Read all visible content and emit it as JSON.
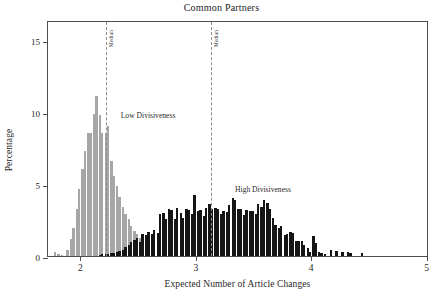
{
  "chart_data": {
    "type": "bar",
    "title": "Common Partners",
    "xlabel": "Expected Number of Article Changes",
    "ylabel": "Percentage",
    "xlim": [
      1.72,
      5.02
    ],
    "ylim": [
      0,
      16.4
    ],
    "xticks": [
      2,
      3,
      4,
      5
    ],
    "xticklabels": [
      "2",
      "3",
      "4",
      "5"
    ],
    "yticks": [
      0,
      5,
      10,
      15
    ],
    "yticklabels": [
      "0",
      "5",
      "10",
      "15"
    ],
    "grid": false,
    "legend_position": "inline-annotations",
    "bin_width": 0.0255,
    "annotations": [
      {
        "text": "Low Divisiveness",
        "x": 2.35,
        "y": 10.2,
        "color": "#2b2b2b"
      },
      {
        "text": "High Divisiveness",
        "x": 3.34,
        "y": 5.1,
        "color": "#2b2b2b"
      },
      {
        "text": "Median",
        "x": 2.22,
        "y": 15.6,
        "orientation": "vertical",
        "color": "#3d3d3d"
      },
      {
        "text": "Median",
        "x": 3.13,
        "y": 15.6,
        "orientation": "vertical",
        "color": "#3d3d3d"
      }
    ],
    "reference_lines": [
      {
        "label": "Median",
        "x": 2.22,
        "style": "dashed",
        "color": "#8c8c8c",
        "series": "Low Divisiveness"
      },
      {
        "label": "Median",
        "x": 3.13,
        "style": "dashed",
        "color": "#8c8c8c",
        "series": "High Divisiveness"
      }
    ],
    "series": [
      {
        "name": "Low Divisiveness",
        "color": "#a6a6a6",
        "x": [
          1.78,
          1.81,
          1.84,
          1.87,
          1.89,
          1.92,
          1.94,
          1.97,
          1.99,
          2.02,
          2.04,
          2.07,
          2.09,
          2.12,
          2.14,
          2.17,
          2.19,
          2.22,
          2.24,
          2.27,
          2.29,
          2.32,
          2.34,
          2.37,
          2.39,
          2.42,
          2.44,
          2.47,
          2.49,
          2.52,
          2.54,
          2.57,
          2.59,
          2.62,
          2.64,
          2.67,
          2.69,
          2.72,
          2.74,
          2.77,
          2.79,
          2.82,
          2.84,
          2.87
        ],
        "values": [
          0.3,
          0.15,
          0.1,
          0.0,
          0.45,
          1.15,
          1.95,
          3.25,
          4.65,
          6.05,
          7.3,
          8.55,
          8.55,
          9.85,
          11.1,
          9.8,
          8.55,
          8.55,
          9.05,
          6.6,
          5.55,
          4.9,
          4.1,
          3.4,
          2.95,
          2.55,
          2.1,
          1.75,
          1.55,
          1.25,
          1.05,
          0.85,
          0.7,
          0.55,
          0.45,
          0.4,
          0.35,
          0.3,
          0.25,
          0.2,
          0.15,
          0.12,
          0.1,
          0.08
        ]
      },
      {
        "name": "High Divisiveness",
        "color": "#151515",
        "x": [
          2.17,
          2.19,
          2.22,
          2.24,
          2.27,
          2.29,
          2.32,
          2.34,
          2.37,
          2.39,
          2.42,
          2.44,
          2.47,
          2.49,
          2.52,
          2.54,
          2.57,
          2.59,
          2.62,
          2.64,
          2.67,
          2.69,
          2.72,
          2.74,
          2.77,
          2.79,
          2.82,
          2.84,
          2.87,
          2.89,
          2.92,
          2.94,
          2.97,
          2.99,
          3.02,
          3.04,
          3.07,
          3.09,
          3.12,
          3.14,
          3.17,
          3.19,
          3.22,
          3.24,
          3.27,
          3.29,
          3.32,
          3.34,
          3.37,
          3.39,
          3.42,
          3.44,
          3.47,
          3.49,
          3.52,
          3.54,
          3.57,
          3.59,
          3.62,
          3.64,
          3.67,
          3.69,
          3.72,
          3.74,
          3.77,
          3.79,
          3.82,
          3.84,
          3.87,
          3.89,
          3.92,
          3.94,
          3.97,
          3.99,
          4.02,
          4.04,
          4.07,
          4.09,
          4.12,
          4.17,
          4.22,
          4.27,
          4.32,
          4.34,
          4.44
        ],
        "values": [
          0.1,
          0.12,
          0.15,
          0.15,
          0.18,
          0.2,
          0.25,
          0.35,
          0.45,
          0.6,
          0.75,
          0.95,
          1.1,
          1.25,
          1.0,
          1.5,
          1.45,
          1.7,
          1.55,
          1.8,
          1.6,
          2.95,
          3.0,
          2.55,
          3.25,
          3.2,
          2.6,
          3.35,
          3.0,
          2.65,
          3.25,
          3.2,
          2.95,
          4.25,
          3.1,
          3.2,
          2.8,
          3.35,
          3.6,
          3.3,
          3.35,
          3.3,
          2.9,
          3.1,
          3.05,
          3.55,
          4.05,
          3.9,
          3.3,
          3.25,
          2.85,
          3.2,
          3.15,
          3.1,
          2.9,
          3.6,
          3.4,
          3.9,
          3.7,
          3.3,
          2.65,
          2.15,
          1.95,
          2.1,
          1.45,
          1.55,
          1.65,
          1.6,
          1.05,
          1.05,
          1.05,
          0.75,
          0.55,
          0.3,
          1.4,
          0.9,
          0.25,
          0.2,
          0.15,
          0.4,
          0.35,
          0.3,
          0.25,
          0.2,
          0.2
        ]
      }
    ]
  }
}
